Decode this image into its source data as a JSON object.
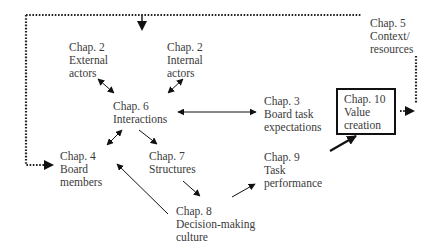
{
  "nodes": {
    "ch2_external": {
      "chapter": "Chap. 2",
      "lines": [
        "External",
        "actors"
      ]
    },
    "ch2_internal": {
      "chapter": "Chap. 2",
      "lines": [
        "Internal",
        "actors"
      ]
    },
    "ch5": {
      "chapter": "Chap. 5",
      "lines": [
        "Context/",
        "resources"
      ]
    },
    "ch6": {
      "chapter": "Chap. 6",
      "lines": [
        "Interactions"
      ]
    },
    "ch3": {
      "chapter": "Chap. 3",
      "lines": [
        "Board task",
        "expectations"
      ]
    },
    "ch10": {
      "chapter": "Chap. 10",
      "lines": [
        "Value",
        "creation"
      ]
    },
    "ch4": {
      "chapter": "Chap. 4",
      "lines": [
        "Board",
        "members"
      ]
    },
    "ch7": {
      "chapter": "Chap. 7",
      "lines": [
        "Structures"
      ]
    },
    "ch9": {
      "chapter": "Chap. 9",
      "lines": [
        "Task",
        "performance"
      ]
    },
    "ch8": {
      "chapter": "Chap. 8",
      "lines": [
        "Decision-making",
        "culture"
      ]
    }
  },
  "edges": [
    {
      "from": "ch2_external",
      "to": "ch6",
      "kind": "bidirectional"
    },
    {
      "from": "ch2_internal",
      "to": "ch6",
      "kind": "bidirectional"
    },
    {
      "from": "ch6",
      "to": "ch3",
      "kind": "bidirectional"
    },
    {
      "from": "ch6",
      "to": "ch4",
      "kind": "bidirectional"
    },
    {
      "from": "ch6",
      "to": "ch7",
      "kind": "directed"
    },
    {
      "from": "ch7",
      "to": "ch8",
      "kind": "directed"
    },
    {
      "from": "ch8",
      "to": "ch4",
      "kind": "directed"
    },
    {
      "from": "ch8",
      "to": "ch9",
      "kind": "directed"
    },
    {
      "from": "ch9",
      "to": "ch10",
      "kind": "directed-bold"
    },
    {
      "from": "ch5",
      "to": "ch2",
      "kind": "dotted"
    },
    {
      "from": "ch5",
      "to": "ch4",
      "kind": "dotted"
    },
    {
      "from": "ch10",
      "to": "ch5",
      "kind": "dotted"
    }
  ],
  "colors": {
    "text": "#3a3a3a",
    "line": "#111111",
    "background": "#ffffff"
  }
}
